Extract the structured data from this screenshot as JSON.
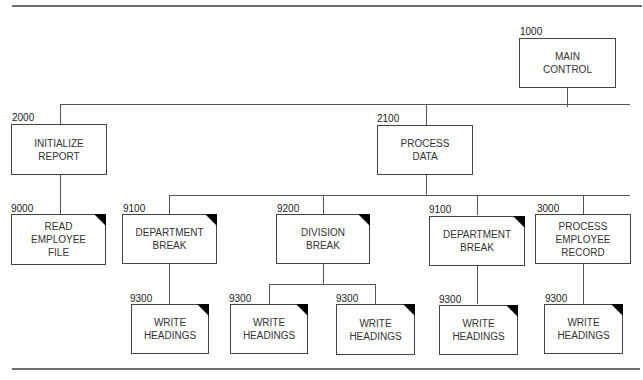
{
  "diagram": {
    "type": "structure-chart",
    "modules": [
      {
        "id": "main",
        "number": "1000",
        "label": "MAIN\nCONTROL",
        "predefined": false
      },
      {
        "id": "init",
        "number": "2000",
        "label": "INITIALIZE\nREPORT",
        "predefined": false
      },
      {
        "id": "process",
        "number": "2100",
        "label": "PROCESS\nDATA",
        "predefined": false
      },
      {
        "id": "read",
        "number": "9000",
        "label": "READ\nEMPLOYEE\nFILE",
        "predefined": true
      },
      {
        "id": "dept1",
        "number": "9100",
        "label": "DEPARTMENT\nBREAK",
        "predefined": true
      },
      {
        "id": "div",
        "number": "9200",
        "label": "DIVISION\nBREAK",
        "predefined": true
      },
      {
        "id": "dept2",
        "number": "9100",
        "label": "DEPARTMENT\nBREAK",
        "predefined": true
      },
      {
        "id": "record",
        "number": "3000",
        "label": "PROCESS\nEMPLOYEE\nRECORD",
        "predefined": false
      },
      {
        "id": "wh1",
        "number": "9300",
        "label": "WRITE\nHEADINGS",
        "predefined": true
      },
      {
        "id": "wh2",
        "number": "9300",
        "label": "WRITE\nHEADINGS",
        "predefined": true
      },
      {
        "id": "wh3",
        "number": "9300",
        "label": "WRITE\nHEADINGS",
        "predefined": true
      },
      {
        "id": "wh4",
        "number": "9300",
        "label": "WRITE\nHEADINGS",
        "predefined": true
      },
      {
        "id": "wh5",
        "number": "9300",
        "label": "WRITE\nHEADINGS",
        "predefined": true
      }
    ],
    "edges": [
      [
        "main",
        "init"
      ],
      [
        "main",
        "process"
      ],
      [
        "init",
        "read"
      ],
      [
        "process",
        "dept1"
      ],
      [
        "process",
        "div"
      ],
      [
        "process",
        "dept2"
      ],
      [
        "process",
        "record"
      ],
      [
        "dept1",
        "wh1"
      ],
      [
        "div",
        "wh2"
      ],
      [
        "div",
        "wh3"
      ],
      [
        "dept2",
        "wh4"
      ],
      [
        "record",
        "wh5"
      ]
    ]
  }
}
